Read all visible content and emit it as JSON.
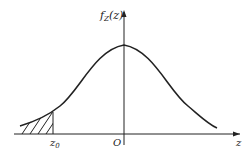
{
  "figure": {
    "y_axis_label": "f",
    "y_axis_label_sub": "Z",
    "y_axis_label_arg": "(z)",
    "x_axis_label": "z",
    "origin_label": "O",
    "marker_label": "z",
    "marker_label_sub": "0",
    "curve": "normal density (bell curve)",
    "shaded_region": "left tail, z < z0",
    "colors": {
      "stroke": "#222222",
      "background": "#ffffff"
    }
  }
}
